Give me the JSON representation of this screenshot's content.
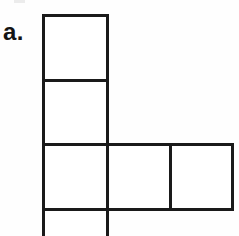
{
  "figure": {
    "label": "a.",
    "kind": "polyomino-net-diagram",
    "canvas": {
      "width": 239,
      "height": 236
    },
    "colors": {
      "background": "#fefefe",
      "stroke": "#1a1a1a",
      "fill": "#ffffff",
      "label": "#141414"
    },
    "stroke_width": 3,
    "grid": {
      "cell_width": 64,
      "cell_height": 65,
      "columns_x": [
        43,
        107,
        170,
        232
      ],
      "rows_y": [
        15,
        80,
        144,
        209,
        236
      ]
    },
    "cells": [
      {
        "name": "cell-top",
        "x": 43,
        "y": 15,
        "width": 64,
        "height": 65,
        "row": 0,
        "col": 0
      },
      {
        "name": "cell-upper-middle",
        "x": 43,
        "y": 80,
        "width": 64,
        "height": 64,
        "row": 1,
        "col": 0
      },
      {
        "name": "cell-center-left",
        "x": 43,
        "y": 144,
        "width": 64,
        "height": 65,
        "row": 2,
        "col": 0
      },
      {
        "name": "cell-center-middle",
        "x": 107,
        "y": 144,
        "width": 63,
        "height": 65,
        "row": 2,
        "col": 1
      },
      {
        "name": "cell-center-right",
        "x": 170,
        "y": 144,
        "width": 62,
        "height": 65,
        "row": 2,
        "col": 2
      },
      {
        "name": "cell-bottom-clipped",
        "x": 43,
        "y": 209,
        "width": 64,
        "height": 40,
        "row": 3,
        "col": 0
      }
    ],
    "cell_count": 6,
    "notes_visible": []
  }
}
